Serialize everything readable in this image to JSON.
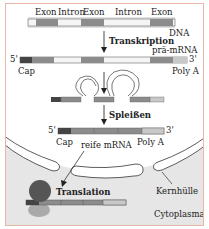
{
  "diagram": {
    "dna": {
      "label": "DNA",
      "segment_labels": [
        "Exon",
        "Intron",
        "Exon",
        "Intron",
        "Exon"
      ]
    },
    "steps": {
      "transcription": "Transkription",
      "splicing": "Spleißen",
      "translation": "Translation"
    },
    "pre_mrna": {
      "label": "prä-mRNA",
      "five_prime": "5'",
      "three_prime": "3'",
      "cap": "Cap",
      "poly_a": "Poly A"
    },
    "mature_mrna": {
      "label": "reife mRNA",
      "five_prime": "5'",
      "three_prime": "3'",
      "cap": "Cap",
      "poly_a": "Poly A"
    },
    "compartments": {
      "nuclear_envelope": "Kernhülle",
      "cytoplasm": "Cytoplasma"
    },
    "colors": {
      "frame_border": "#e6b7a6",
      "cytoplasm": "#e6e6e6",
      "exon": "#8c8c8c",
      "intron": "#f5f5f5",
      "cap": "#444444",
      "poly_a": "#c8c8c8",
      "ribosome_large": "#555555",
      "ribosome_small": "#aaaaaa"
    }
  }
}
